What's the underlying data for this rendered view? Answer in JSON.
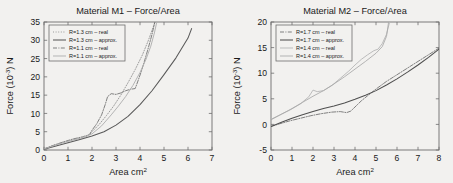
{
  "figure": {
    "background_color": "#f2f1ef",
    "axis_color": "#6e6e6e",
    "text_color": "#1a1a1a"
  },
  "chart_data": [
    {
      "type": "line",
      "id": "material-m1",
      "title": "Material M1 – Force/Area",
      "xlabel": "Area cm",
      "xlabel_sup": "2",
      "ylabel": "Force (10",
      "ylabel_sup": "-3",
      "ylabel_tail": ") N",
      "xlim": [
        0,
        7
      ],
      "ylim": [
        0,
        35
      ],
      "xticks": [
        0,
        1,
        2,
        3,
        4,
        5,
        6,
        7
      ],
      "yticks": [
        0,
        5,
        10,
        15,
        20,
        25,
        30,
        35
      ],
      "grid": false,
      "legend_position": "upper left",
      "series": [
        {
          "name": "R=1.3 cm – real",
          "style": "dotted",
          "color": "#8c8c8c",
          "points": [
            [
              0,
              0.3
            ],
            [
              0.3,
              1.0
            ],
            [
              0.7,
              1.9
            ],
            [
              1.1,
              2.6
            ],
            [
              1.5,
              3.2
            ],
            [
              1.8,
              3.8
            ],
            [
              2.0,
              5.0
            ],
            [
              2.3,
              7.0
            ],
            [
              2.6,
              9.4
            ],
            [
              2.9,
              12.0
            ],
            [
              3.2,
              15.0
            ],
            [
              3.5,
              18.4
            ],
            [
              3.8,
              22.0
            ],
            [
              4.1,
              26.0
            ],
            [
              4.35,
              30.0
            ],
            [
              4.55,
              33.6
            ],
            [
              4.62,
              35.0
            ]
          ]
        },
        {
          "name": "R=1.3 cm – approx.",
          "style": "solid",
          "color": "#595959",
          "points": [
            [
              0,
              0.2
            ],
            [
              0.5,
              1.1
            ],
            [
              1.0,
              2.0
            ],
            [
              1.5,
              2.9
            ],
            [
              2.0,
              3.8
            ],
            [
              2.5,
              5.0
            ],
            [
              3.0,
              6.8
            ],
            [
              3.5,
              9.2
            ],
            [
              4.0,
              12.4
            ],
            [
              4.5,
              16.2
            ],
            [
              5.0,
              20.6
            ],
            [
              5.5,
              25.2
            ],
            [
              6.0,
              30.6
            ],
            [
              6.15,
              33.2
            ]
          ]
        },
        {
          "name": "R=1.1 cm – real",
          "style": "dashdot",
          "color": "#6b6b6b",
          "points": [
            [
              0,
              0.3
            ],
            [
              0.4,
              1.3
            ],
            [
              0.8,
              2.2
            ],
            [
              1.2,
              3.0
            ],
            [
              1.6,
              3.6
            ],
            [
              1.9,
              4.2
            ],
            [
              2.0,
              5.4
            ],
            [
              2.2,
              7.2
            ],
            [
              2.4,
              9.6
            ],
            [
              2.55,
              12.4
            ],
            [
              2.65,
              14.6
            ],
            [
              2.8,
              15.4
            ],
            [
              3.0,
              15.2
            ],
            [
              3.2,
              15.6
            ],
            [
              3.4,
              16.2
            ],
            [
              3.6,
              16.6
            ],
            [
              3.8,
              16.8
            ],
            [
              3.9,
              18.6
            ],
            [
              4.05,
              21.4
            ],
            [
              4.2,
              24.6
            ],
            [
              4.35,
              28.0
            ],
            [
              4.5,
              31.6
            ],
            [
              4.62,
              35.0
            ]
          ]
        },
        {
          "name": "R=1.1 cm – approx.",
          "style": "solid-light",
          "color": "#b0b0b0",
          "points": [
            [
              0,
              0.3
            ],
            [
              0.5,
              1.4
            ],
            [
              1.0,
              2.4
            ],
            [
              1.5,
              3.2
            ],
            [
              2.0,
              4.4
            ],
            [
              2.4,
              6.6
            ],
            [
              2.8,
              9.6
            ],
            [
              3.1,
              12.0
            ],
            [
              3.4,
              14.6
            ],
            [
              3.7,
              17.6
            ],
            [
              4.0,
              21.2
            ],
            [
              4.25,
              24.8
            ],
            [
              4.45,
              28.4
            ],
            [
              4.6,
              32.0
            ],
            [
              4.7,
              35.0
            ]
          ]
        }
      ]
    },
    {
      "type": "line",
      "id": "material-m2",
      "title": "Material M2 – Force/Area",
      "xlabel": "Area cm",
      "xlabel_sup": "2",
      "ylabel": "Force (10",
      "ylabel_sup": "-3",
      "ylabel_tail": ") N",
      "xlim": [
        0,
        8
      ],
      "ylim": [
        -5,
        20
      ],
      "xticks": [
        0,
        1,
        2,
        3,
        4,
        5,
        6,
        7,
        8
      ],
      "yticks": [
        -5,
        0,
        5,
        10,
        15,
        20
      ],
      "grid": false,
      "legend_position": "upper left",
      "series": [
        {
          "name": "R=1.7 cm – real",
          "style": "dashdot",
          "color": "#6b6b6b",
          "points": [
            [
              0,
              -0.4
            ],
            [
              0.4,
              0.1
            ],
            [
              0.9,
              0.7
            ],
            [
              1.4,
              1.2
            ],
            [
              1.9,
              1.7
            ],
            [
              2.4,
              2.1
            ],
            [
              2.9,
              2.4
            ],
            [
              3.3,
              2.5
            ],
            [
              3.6,
              2.3
            ],
            [
              3.8,
              2.6
            ],
            [
              4.0,
              3.4
            ],
            [
              4.3,
              4.6
            ],
            [
              4.6,
              5.6
            ],
            [
              5.0,
              6.9
            ],
            [
              5.5,
              8.4
            ],
            [
              6.0,
              9.7
            ],
            [
              6.5,
              11.0
            ],
            [
              7.0,
              12.3
            ],
            [
              7.5,
              13.6
            ],
            [
              8.0,
              14.9
            ]
          ]
        },
        {
          "name": "R=1.7 cm – approx.",
          "style": "solid",
          "color": "#4f4f4f",
          "points": [
            [
              0,
              -0.4
            ],
            [
              0.5,
              0.4
            ],
            [
              1.0,
              1.2
            ],
            [
              1.5,
              1.9
            ],
            [
              2.0,
              2.5
            ],
            [
              2.5,
              3.1
            ],
            [
              3.0,
              3.6
            ],
            [
              3.5,
              4.2
            ],
            [
              4.0,
              4.9
            ],
            [
              4.5,
              5.7
            ],
            [
              5.0,
              6.6
            ],
            [
              5.5,
              7.7
            ],
            [
              6.0,
              8.9
            ],
            [
              6.5,
              10.2
            ],
            [
              7.0,
              11.6
            ],
            [
              7.5,
              13.1
            ],
            [
              8.0,
              14.7
            ]
          ]
        },
        {
          "name": "R=1.4 cm – real",
          "style": "solid-light",
          "color": "#b8b8b8",
          "points": [
            [
              0,
              1.0
            ],
            [
              0.4,
              1.8
            ],
            [
              0.9,
              2.8
            ],
            [
              1.4,
              4.0
            ],
            [
              1.8,
              5.4
            ],
            [
              2.0,
              6.7
            ],
            [
              2.2,
              6.4
            ],
            [
              2.5,
              6.6
            ],
            [
              2.9,
              7.6
            ],
            [
              3.3,
              9.0
            ],
            [
              3.7,
              10.4
            ],
            [
              4.0,
              11.6
            ],
            [
              4.3,
              12.7
            ],
            [
              4.6,
              13.6
            ],
            [
              4.9,
              14.4
            ],
            [
              5.1,
              14.7
            ],
            [
              5.3,
              15.8
            ],
            [
              5.5,
              17.6
            ],
            [
              5.65,
              20.0
            ]
          ]
        },
        {
          "name": "R=1.4 cm – approx.",
          "style": "solid-light2",
          "color": "#a8a8a8",
          "points": [
            [
              0,
              0.9
            ],
            [
              0.5,
              2.0
            ],
            [
              1.0,
              3.1
            ],
            [
              1.5,
              4.3
            ],
            [
              2.0,
              5.5
            ],
            [
              2.5,
              6.6
            ],
            [
              3.0,
              7.9
            ],
            [
              3.5,
              9.3
            ],
            [
              4.0,
              10.8
            ],
            [
              4.5,
              12.3
            ],
            [
              5.0,
              13.9
            ],
            [
              5.3,
              15.2
            ],
            [
              5.5,
              17.2
            ],
            [
              5.6,
              20.0
            ]
          ]
        }
      ]
    }
  ]
}
